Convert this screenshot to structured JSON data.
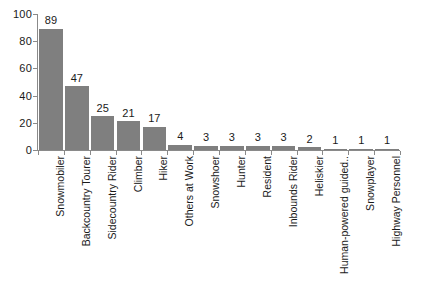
{
  "chart_data": {
    "type": "bar",
    "title": "",
    "subtitle": "",
    "xlabel": "",
    "ylabel": "",
    "ylim": [
      0,
      100
    ],
    "grid": false,
    "legend": "none",
    "orientation": "vertical",
    "bar_color": "#7f7f7f",
    "axis_color": "#8a8a8a",
    "text_color": "#1a1a1a",
    "background": "#ffffff",
    "y_ticks": [
      "0",
      "20",
      "40",
      "60",
      "80",
      "100"
    ],
    "y_tick_values": [
      0,
      20,
      40,
      60,
      80,
      100
    ],
    "categories": [
      "Snowmobiler",
      "Backcountry Tourer",
      "Sidecountry Rider",
      "Climber",
      "Hiker",
      "Others at Work",
      "Snowshoer",
      "Hunter",
      "Resident",
      "Inbounds Rider",
      "Heliskier",
      "Human-powered guided..",
      "Snowplayer",
      "Highway Personnel"
    ],
    "values": [
      89,
      47,
      25,
      21,
      17,
      4,
      3,
      3,
      3,
      3,
      2,
      1,
      1,
      1
    ],
    "value_labels": [
      "89",
      "47",
      "25",
      "21",
      "17",
      "4",
      "3",
      "3",
      "3",
      "3",
      "2",
      "1",
      "1",
      "1"
    ]
  }
}
